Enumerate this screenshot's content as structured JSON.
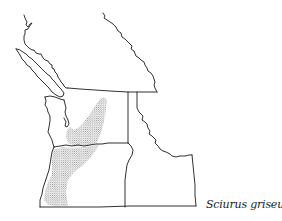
{
  "figure": {
    "type": "species-range-map",
    "species_label": "Sciurus griseus",
    "range_pattern": "stippled",
    "regions_shown": [
      "British Columbia (southern)",
      "Alberta (southwestern)",
      "Washington",
      "Oregon",
      "Idaho"
    ],
    "range_regions": [
      "western Washington (Puget lowland to Columbia Gorge)",
      "western Oregon (Willamette Valley to southern Oregon)"
    ]
  },
  "colors": {
    "background": "#ffffff",
    "line": "#1a1a1a",
    "stipple": "#555555",
    "label": "#222222"
  }
}
